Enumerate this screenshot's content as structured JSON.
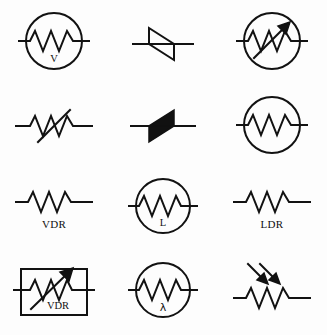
{
  "sheet": {
    "title": "Resistor and sensor circuit symbols",
    "background_color": "#fdfdfd",
    "stroke_color": "#121212",
    "columns": 3,
    "rows": 4
  },
  "symbols": [
    {
      "id": "voltage-dependent-resistor-circle",
      "row": 1,
      "col": 1,
      "shape": "circle",
      "element": "zigzag-resistor",
      "inner_label": "V",
      "outer_label": "",
      "has_arrow": false
    },
    {
      "id": "zener-diode-outline",
      "row": 1,
      "col": 2,
      "shape": "none",
      "element": "diode-triangle-outline",
      "inner_label": "",
      "outer_label": "",
      "has_arrow": false
    },
    {
      "id": "variable-resistor-circle-arrow",
      "row": 1,
      "col": 3,
      "shape": "circle",
      "element": "zigzag-resistor",
      "inner_label": "",
      "outer_label": "",
      "has_arrow": true
    },
    {
      "id": "variable-resistor-slash",
      "row": 2,
      "col": 1,
      "shape": "none",
      "element": "zigzag-resistor-with-slash",
      "inner_label": "",
      "outer_label": "",
      "has_arrow": false
    },
    {
      "id": "diac-filled",
      "row": 2,
      "col": 2,
      "shape": "none",
      "element": "diode-triangle-filled",
      "inner_label": "",
      "outer_label": "",
      "has_arrow": false
    },
    {
      "id": "resistor-circle-plain",
      "row": 2,
      "col": 3,
      "shape": "circle",
      "element": "zigzag-resistor",
      "inner_label": "",
      "outer_label": "",
      "has_arrow": false
    },
    {
      "id": "vdr-plain",
      "row": 3,
      "col": 1,
      "shape": "none",
      "element": "zigzag-resistor",
      "inner_label": "",
      "outer_label": "VDR",
      "has_arrow": false
    },
    {
      "id": "ldr-circle-l",
      "row": 3,
      "col": 2,
      "shape": "circle",
      "element": "zigzag-resistor",
      "inner_label": "L",
      "outer_label": "",
      "has_arrow": false
    },
    {
      "id": "ldr-plain",
      "row": 3,
      "col": 3,
      "shape": "none",
      "element": "zigzag-resistor",
      "inner_label": "",
      "outer_label": "LDR",
      "has_arrow": false
    },
    {
      "id": "vdr-boxed-arrow",
      "row": 4,
      "col": 1,
      "shape": "rectangle",
      "element": "zigzag-resistor",
      "inner_label": "VDR",
      "outer_label": "",
      "has_arrow": true
    },
    {
      "id": "ldr-circle-lambda",
      "row": 4,
      "col": 2,
      "shape": "circle",
      "element": "zigzag-resistor",
      "inner_label": "λ",
      "outer_label": "",
      "has_arrow": false
    },
    {
      "id": "ldr-light-arrows",
      "row": 4,
      "col": 3,
      "shape": "none",
      "element": "zigzag-resistor-with-light-arrows",
      "inner_label": "",
      "outer_label": "",
      "has_arrow": true
    }
  ],
  "labels": {
    "vdr": "VDR",
    "ldr": "LDR",
    "v": "V",
    "l": "L",
    "lambda": "λ"
  }
}
